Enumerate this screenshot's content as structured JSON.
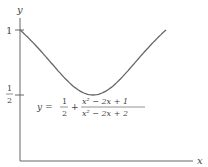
{
  "chart_data": {
    "type": "line",
    "title": "",
    "xlabel": "x",
    "ylabel": "y",
    "y_ticks": [
      {
        "value": 1,
        "label": "1"
      },
      {
        "value": 0.5,
        "label": "1/2"
      }
    ],
    "annotation": "y = 1/2 + (x^2 - 2x + 1)/(x^2 - 2x + 2)",
    "series": [
      {
        "name": "y = 1/2 + (x^2-2x+1)/(x^2-2x+2)",
        "x": [
          0,
          0.25,
          0.5,
          0.75,
          1,
          1.25,
          1.5,
          1.75,
          2
        ],
        "values": [
          1,
          0.86,
          0.7,
          0.56,
          0.5,
          0.56,
          0.7,
          0.86,
          1
        ]
      }
    ],
    "xlim": [
      0,
      2.4
    ],
    "ylim": [
      0,
      1.05
    ],
    "grid": false
  },
  "labels": {
    "x_axis": "x",
    "y_axis": "y",
    "tick_one": "1",
    "half_num": "1",
    "half_den": "2",
    "eq_lhs": "y = ",
    "eq_frac_num": "1",
    "eq_frac_den": "2",
    "eq_plus": "+",
    "eq_num": "x² − 2x + 1",
    "eq_den": "x² − 2x + 2"
  }
}
